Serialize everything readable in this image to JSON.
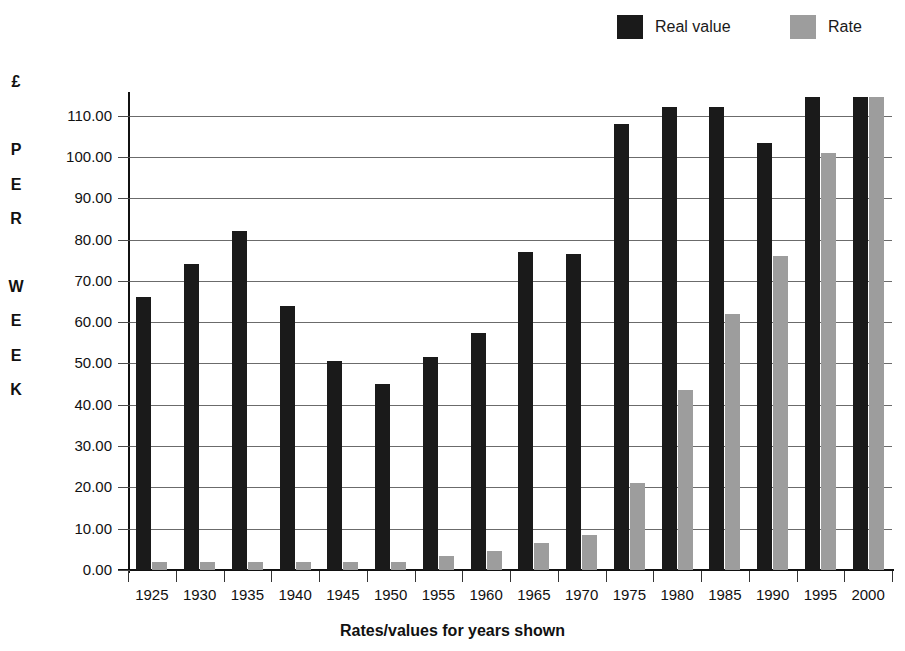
{
  "legend": {
    "position": "top-right",
    "items": [
      {
        "label": "Real value",
        "color": "#1a1a1a",
        "icon": "legend-swatch-black"
      },
      {
        "label": "Rate",
        "color": "#9d9d9d",
        "icon": "legend-swatch-gray"
      }
    ]
  },
  "axes": {
    "y_title_chars": [
      "£",
      "",
      "P",
      "E",
      "R",
      "",
      "W",
      "E",
      "E",
      "K"
    ],
    "y_title_text": "£ PER WEEK",
    "x_title": "Rates/values for years shown"
  },
  "chart_data": {
    "type": "bar",
    "title": "",
    "subtitle": "",
    "xlabel": "Rates/values for years shown",
    "ylabel": "£ PER WEEK",
    "ylim": [
      0,
      115
    ],
    "ytick_values": [
      0,
      10,
      20,
      30,
      40,
      50,
      60,
      70,
      80,
      90,
      100,
      110
    ],
    "ytick_labels": [
      "0.00",
      "10.00",
      "20.00",
      "30.00",
      "40.00",
      "50.00",
      "60.00",
      "70.00",
      "80.00",
      "90.00",
      "100.00",
      "110.00"
    ],
    "grid": true,
    "grid_axis": "y",
    "legend_position": "top-right",
    "categories": [
      "1925",
      "1930",
      "1935",
      "1940",
      "1945",
      "1950",
      "1955",
      "1960",
      "1965",
      "1970",
      "1975",
      "1980",
      "1985",
      "1990",
      "1995",
      "2000"
    ],
    "series": [
      {
        "name": "Real value",
        "color": "#1a1a1a",
        "values": [
          66.0,
          74.0,
          82.0,
          64.0,
          50.5,
          45.0,
          51.5,
          57.5,
          77.0,
          76.5,
          108.0,
          112.0,
          112.0,
          103.5,
          114.5,
          114.5
        ]
      },
      {
        "name": "Rate",
        "color": "#9d9d9d",
        "values": [
          2.0,
          2.0,
          2.0,
          2.0,
          2.0,
          2.0,
          3.5,
          4.5,
          6.5,
          8.5,
          21.0,
          43.5,
          62.0,
          76.0,
          101.0,
          114.5
        ]
      }
    ]
  }
}
